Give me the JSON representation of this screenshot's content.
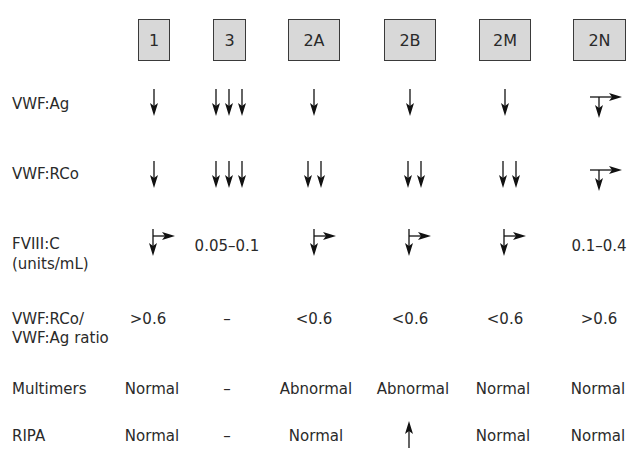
{
  "columns": [
    {
      "label": "1",
      "x": 154
    },
    {
      "label": "3",
      "x": 229
    },
    {
      "label": "2A",
      "x": 314
    },
    {
      "label": "2B",
      "x": 410
    },
    {
      "label": "2M",
      "x": 505
    },
    {
      "label": "2N",
      "x": 599
    }
  ],
  "rows": [
    {
      "label": "VWF:Ag",
      "cells": [
        "down",
        "down-down-down",
        "down",
        "down",
        "down",
        "down-or-normal"
      ]
    },
    {
      "label": "VWF:RCo",
      "cells": [
        "down",
        "down-down-down",
        "down-down",
        "down-down",
        "down-down",
        "down-or-normal"
      ]
    },
    {
      "label": "FVIII:C",
      "label2": "(units/mL)",
      "cells": [
        "down-or-normal",
        "0.05–0.1",
        "down-or-normal",
        "down-or-normal",
        "down-or-normal",
        "0.1–0.4"
      ]
    },
    {
      "label": "VWF:RCo/",
      "label2": "VWF:Ag ratio",
      "cells": [
        ">0.6",
        "–",
        "<0.6",
        "<0.6",
        "<0.6",
        ">0.6"
      ]
    },
    {
      "label": "Multimers",
      "cells": [
        "Normal",
        "–",
        "Abnormal",
        "Abnormal",
        "Normal",
        "Normal"
      ]
    },
    {
      "label": "RIPA",
      "cells": [
        "Normal",
        "–",
        "Normal",
        "up",
        "Normal",
        "Normal"
      ]
    }
  ],
  "text": {
    "h1": "1",
    "h3": "3",
    "h2a": "2A",
    "h2b": "2B",
    "h2m": "2M",
    "h2n": "2N",
    "r_ag": "VWF:Ag",
    "r_rco": "VWF:RCo",
    "r_f8": "FVIII:C",
    "r_f8b": "(units/mL)",
    "r_ratio": "VWF:RCo/",
    "r_ratio2": "VWF:Ag ratio",
    "r_mult": "Multimers",
    "r_ripa": "RIPA",
    "f8_3": "0.05–0.1",
    "f8_2n": "0.1–0.4",
    "ratio_1": ">0.6",
    "ratio_3": "–",
    "ratio_2a": "<0.6",
    "ratio_2b": "<0.6",
    "ratio_2m": "<0.6",
    "ratio_2n": ">0.6",
    "mult_1": "Normal",
    "mult_3": "–",
    "mult_2a": "Abnormal",
    "mult_2b": "Abnormal",
    "mult_2m": "Normal",
    "mult_2n": "Normal",
    "ripa_1": "Normal",
    "ripa_3": "–",
    "ripa_2a": "Normal",
    "ripa_2m": "Normal",
    "ripa_2n": "Normal"
  },
  "colors": {
    "header_fill": "#d8d8d8",
    "header_border": "#3a3a3a",
    "text": "#2a2a2a",
    "arrow": "#111111"
  }
}
